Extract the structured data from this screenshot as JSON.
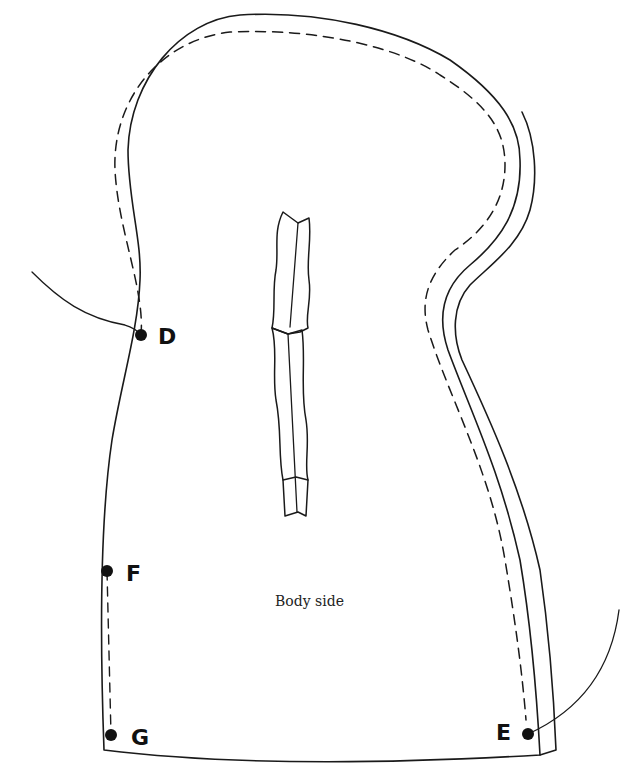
{
  "diagram": {
    "title": "Body side",
    "line_color": "#1a1a1a",
    "background": "#ffffff",
    "points": [
      {
        "id": "D",
        "label": "D",
        "x": 141,
        "y": 335
      },
      {
        "id": "F",
        "label": "F",
        "x": 107,
        "y": 571
      },
      {
        "id": "G",
        "label": "G",
        "x": 111,
        "y": 735
      },
      {
        "id": "E",
        "label": "E",
        "x": 528,
        "y": 734
      }
    ],
    "features": {
      "outer_cutting_line": "solid",
      "seam_allowance_line": "dashed",
      "side_layer_lines": "double solid",
      "center_pleat": "folded dart",
      "leader_lines": [
        "D",
        "E"
      ],
      "dashed_connector": "F-G"
    }
  }
}
